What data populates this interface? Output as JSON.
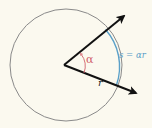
{
  "diagram": {
    "type": "arc-length-on-circle",
    "labels": {
      "angle": "α",
      "radius": "r",
      "arc_length": "s = αr"
    },
    "colors": {
      "background": "#fbf9ef",
      "circle": "#8a8a8a",
      "rays": "#111111",
      "arc": "#5aa0c8",
      "angle_mark": "#d0606a"
    },
    "geometry": {
      "center": [
        66,
        65
      ],
      "radius": 56,
      "vertex": [
        64,
        65
      ],
      "upper_ray_tip": [
        125,
        15
      ],
      "lower_ray_tip": [
        137,
        93
      ]
    }
  }
}
